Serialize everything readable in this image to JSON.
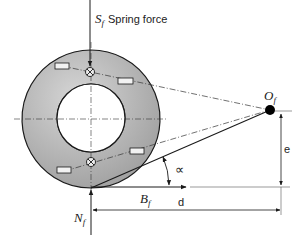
{
  "diagram": {
    "type": "free-body diagram",
    "colors": {
      "wheel_fill": "#a9a9a9",
      "wheel_fill_light": "#d2d2d2",
      "stroke": "#1a1a1a",
      "background": "#ffffff"
    },
    "labels": {
      "spring_force_symbol": "S",
      "spring_force_sub": "f",
      "spring_force_text": "Spring force",
      "pivot_symbol": "O",
      "pivot_sub": "f",
      "brake_force_symbol": "B",
      "brake_force_sub": "f",
      "normal_force_symbol": "N",
      "normal_force_sub": "f",
      "angle_symbol": "∝",
      "dim_e": "e",
      "dim_d": "d"
    }
  }
}
